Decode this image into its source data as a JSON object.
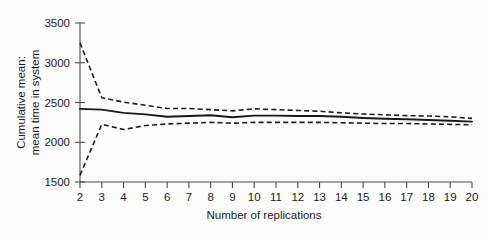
{
  "chart_data": {
    "type": "line",
    "title": "",
    "xlabel": "Number of replications",
    "ylabel": "Cumulative mean: mean time in system",
    "ylabel_lines": [
      "Cumulative mean:",
      "mean time in system"
    ],
    "x": [
      2,
      3,
      4,
      5,
      6,
      7,
      8,
      9,
      10,
      11,
      12,
      13,
      14,
      15,
      16,
      17,
      18,
      19,
      20
    ],
    "xlim": [
      2,
      20
    ],
    "ylim": [
      1500,
      3500
    ],
    "xticks": [
      2,
      3,
      4,
      5,
      6,
      7,
      8,
      9,
      10,
      11,
      12,
      13,
      14,
      15,
      16,
      17,
      18,
      19,
      20
    ],
    "xtick_labels": [
      "2",
      "3",
      "4",
      "5",
      "6",
      "7",
      "8",
      "9",
      "10",
      "11",
      "12",
      "13",
      "14",
      "15",
      "16",
      "17",
      "18",
      "19",
      "20"
    ],
    "yticks": [
      1500,
      2000,
      2500,
      3000,
      3500
    ],
    "ytick_labels": [
      "1500",
      "2000",
      "2500",
      "3000",
      "3500"
    ],
    "grid": false,
    "legend": false,
    "series": [
      {
        "name": "Upper 95% confidence limit",
        "style": "dashed",
        "values": [
          3250,
          2560,
          2505,
          2465,
          2425,
          2425,
          2410,
          2395,
          2420,
          2410,
          2400,
          2390,
          2370,
          2355,
          2345,
          2335,
          2330,
          2320,
          2300
        ]
      },
      {
        "name": "Cumulative mean",
        "style": "solid",
        "values": [
          2420,
          2410,
          2370,
          2350,
          2320,
          2330,
          2340,
          2315,
          2335,
          2335,
          2330,
          2330,
          2320,
          2305,
          2295,
          2290,
          2280,
          2270,
          2260
        ]
      },
      {
        "name": "Lower 95% confidence limit",
        "style": "dashed",
        "values": [
          1585,
          2225,
          2160,
          2210,
          2230,
          2240,
          2250,
          2240,
          2250,
          2250,
          2250,
          2250,
          2245,
          2240,
          2235,
          2235,
          2230,
          2225,
          2220
        ]
      }
    ]
  },
  "figure": {
    "background_color": "#fdfdfd",
    "axis_color": "#4a4a4a",
    "line_color": "#191919"
  }
}
